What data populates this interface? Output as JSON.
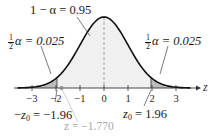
{
  "chart_data": {
    "type": "area",
    "title": "",
    "xlabel": "z",
    "ylabel": "",
    "xlim": [
      -3.6,
      3.6
    ],
    "x_ticks": [
      -3,
      -2,
      -1,
      0,
      1,
      2,
      3
    ],
    "x_tick_labels": [
      "−3",
      "−2",
      "−1",
      "0",
      "1",
      "2",
      "3"
    ],
    "grid": false,
    "regions": [
      {
        "name": "left-tail",
        "from": -3.6,
        "to": -1.96,
        "area": 0.025,
        "shaded": true
      },
      {
        "name": "center",
        "from": -1.96,
        "to": 1.96,
        "area": 0.95,
        "shaded": "light"
      },
      {
        "name": "right-tail",
        "from": 1.96,
        "to": 3.6,
        "area": 0.025,
        "shaded": true
      }
    ],
    "critical_values": [
      -1.96,
      1.96
    ],
    "test_statistic": -1.77,
    "annotations": [
      {
        "text": "1 − α = 0.95",
        "target": "center"
      },
      {
        "text": "½α = 0.025",
        "target": "left-tail"
      },
      {
        "text": "½α = 0.025",
        "target": "right-tail"
      },
      {
        "text": "−z0 = −1.96",
        "target": "left-critical"
      },
      {
        "text": "z0 = 1.96",
        "target": "right-critical"
      },
      {
        "text": "z = −1.770",
        "target": "test-statistic"
      }
    ]
  },
  "labels": {
    "center_area": "1 − α = 0.95",
    "left_tail": {
      "frac_num": "1",
      "frac_den": "2",
      "rest": "α = 0.025"
    },
    "right_tail": {
      "frac_num": "1",
      "frac_den": "2",
      "rest": "α = 0.025"
    },
    "neg_crit": {
      "prefix": "−",
      "var": "z",
      "sub": "0",
      "rest": " = −1.96"
    },
    "pos_crit": {
      "var": "z",
      "sub": "0",
      "rest": " = 1.96"
    },
    "test_stat": "z = −1.770",
    "axis_label": "z"
  },
  "ticks": [
    {
      "label": "−3",
      "x": 32
    },
    {
      "label": "−2",
      "x": 56
    },
    {
      "label": "−1",
      "x": 80
    },
    {
      "label": "0",
      "x": 104
    },
    {
      "label": "1",
      "x": 128
    },
    {
      "label": "2",
      "x": 152
    },
    {
      "label": "3",
      "x": 176
    }
  ],
  "colors": {
    "curve": "#111111",
    "tail_fill": "#bdbdbd",
    "center_fill": "#f0f0f0",
    "axis": "#333333",
    "dashed_center": "#9a9a9a",
    "test_stat": "#a8a8a8"
  }
}
